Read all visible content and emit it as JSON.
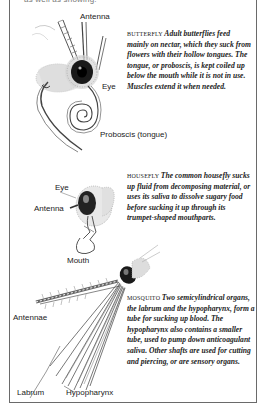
{
  "page": {
    "top_cut_text": "as well as showing:"
  },
  "sections": [
    {
      "id": "butterfly",
      "title": "Butterfly",
      "caption": "Adult butterflies feed mainly on nectar, which they suck from flowers with their hollow tongues. The tongue, or proboscis, is kept coiled up below the mouth while it is not in use. Muscles extend it when needed.",
      "labels": {
        "antenna": "Antenna",
        "eye": "Eye",
        "proboscis": "Proboscis (tongue)"
      }
    },
    {
      "id": "housefly",
      "title": "Housefly",
      "caption": "The common housefly sucks up fluid from decomposing material, or uses its saliva to dissolve sugary food before sucking it up through its trumpet-shaped mouthparts.",
      "labels": {
        "eye": "Eye",
        "antenna": "Antenna",
        "mouth": "Mouth"
      }
    },
    {
      "id": "mosquito",
      "title": "Mosquito",
      "caption": "Two semicylindrical organs, the labrum and the hypopharynx, form a tube for sucking up blood. The hypopharynx also contains a smaller tube, used to pump down anticoagulant saliva. Other shafts are used for cutting and piercing, or are sensory organs.",
      "labels": {
        "antennae": "Antennae",
        "labrum": "Labrum",
        "hypopharynx": "Hypopharynx"
      }
    }
  ]
}
